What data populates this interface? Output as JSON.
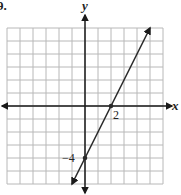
{
  "problem_number": "9.",
  "axes": {
    "x_label": "x",
    "y_label": "y"
  },
  "annotations": {
    "x_intercept_label": "2",
    "y_intercept_label": "−4"
  },
  "colors": {
    "grid": "#b8b8b8",
    "axis": "#1a1a1a",
    "line": "#2a2a2a"
  },
  "chart_data": {
    "type": "line",
    "title": "",
    "xlabel": "x",
    "ylabel": "y",
    "xlim": [
      -6,
      6
    ],
    "ylim": [
      -6,
      6
    ],
    "grid": true,
    "series": [
      {
        "name": "y = 2x - 4",
        "x": [
          -1,
          5
        ],
        "y": [
          -6,
          6
        ],
        "slope": 2,
        "intercept": -4
      }
    ],
    "points": [
      {
        "x": 2,
        "y": 0,
        "label": "2"
      },
      {
        "x": 0,
        "y": -4,
        "label": "−4"
      }
    ],
    "annotations": [
      "2",
      "−4"
    ],
    "legend": null
  }
}
